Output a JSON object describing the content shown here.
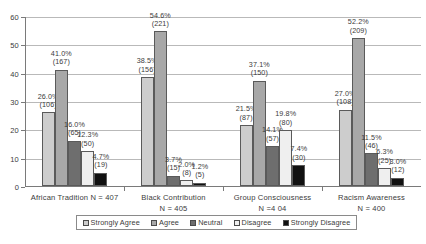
{
  "chart_data": {
    "type": "bar",
    "title": "",
    "xlabel": "",
    "ylabel": "",
    "ylim": [
      0,
      60
    ],
    "yticks": [
      0,
      10,
      20,
      30,
      40,
      50,
      60
    ],
    "ytick_labels": [
      "0",
      "10",
      "20",
      "30",
      "40",
      "50",
      "60"
    ],
    "grid": true,
    "legend_position": "bottom",
    "categories": [
      "African Tradition N = 407",
      "Black Contribution\nN = 405",
      "Group Consciousness\nN =4 04",
      "Racism Awareness\nN = 400"
    ],
    "category_lines": [
      [
        "African Tradition N = 407"
      ],
      [
        "Black Contribution",
        "N = 405"
      ],
      [
        "Group Consciousness",
        "N =4 04"
      ],
      [
        "Racism Awareness",
        "N = 400"
      ]
    ],
    "series": [
      {
        "name": "Strongly Agree",
        "color": "#cdcdcd",
        "values": [
          26.0,
          38.5,
          21.5,
          27.0
        ],
        "counts": [
          106,
          156,
          87,
          108
        ],
        "labels": [
          "26.0%",
          "38.5%",
          "21.5%",
          "27.0%"
        ],
        "count_labels": [
          "(106)",
          "(156)",
          "(87)",
          "(108)"
        ]
      },
      {
        "name": "Agree",
        "color": "#a8a8a8",
        "values": [
          41.0,
          54.6,
          37.1,
          52.2
        ],
        "counts": [
          167,
          221,
          150,
          209
        ],
        "labels": [
          "41.0%",
          "54.6%",
          "37.1%",
          "52.2%"
        ],
        "count_labels": [
          "(167)",
          "(221)",
          "(150)",
          "(209)"
        ]
      },
      {
        "name": "Neutral",
        "color": "#6e6e6e",
        "values": [
          16.0,
          3.7,
          14.1,
          11.5
        ],
        "counts": [
          65,
          15,
          57,
          46
        ],
        "labels": [
          "16.0%",
          "3.7%",
          "14.1%",
          "11.5%"
        ],
        "count_labels": [
          "(65)",
          "(15)",
          "(57)",
          "(46)"
        ]
      },
      {
        "name": "Disagree",
        "color": "#efefef",
        "values": [
          12.3,
          2.0,
          19.8,
          6.3
        ],
        "counts": [
          50,
          8,
          80,
          25
        ],
        "labels": [
          "12.3%",
          "2.0%",
          "19.8%",
          "6.3%"
        ],
        "count_labels": [
          "(50)",
          "(8)",
          "(80)",
          "(25)"
        ]
      },
      {
        "name": "Strongly Disagree",
        "color": "#111111",
        "values": [
          4.7,
          1.2,
          7.4,
          3.0
        ],
        "counts": [
          19,
          5,
          30,
          12
        ],
        "labels": [
          "4.7%",
          "1.2%",
          "7.4%",
          "3.0%"
        ],
        "count_labels": [
          "(19)",
          "(5)",
          "(30)",
          "(12)"
        ]
      }
    ]
  },
  "legend": {
    "items": [
      {
        "label": "Strongly Agree",
        "color": "#cdcdcd"
      },
      {
        "label": "Agree",
        "color": "#a8a8a8"
      },
      {
        "label": "Neutral",
        "color": "#6e6e6e"
      },
      {
        "label": "Disagree",
        "color": "#efefef"
      },
      {
        "label": "Strongly Disagree",
        "color": "#111111"
      }
    ]
  }
}
